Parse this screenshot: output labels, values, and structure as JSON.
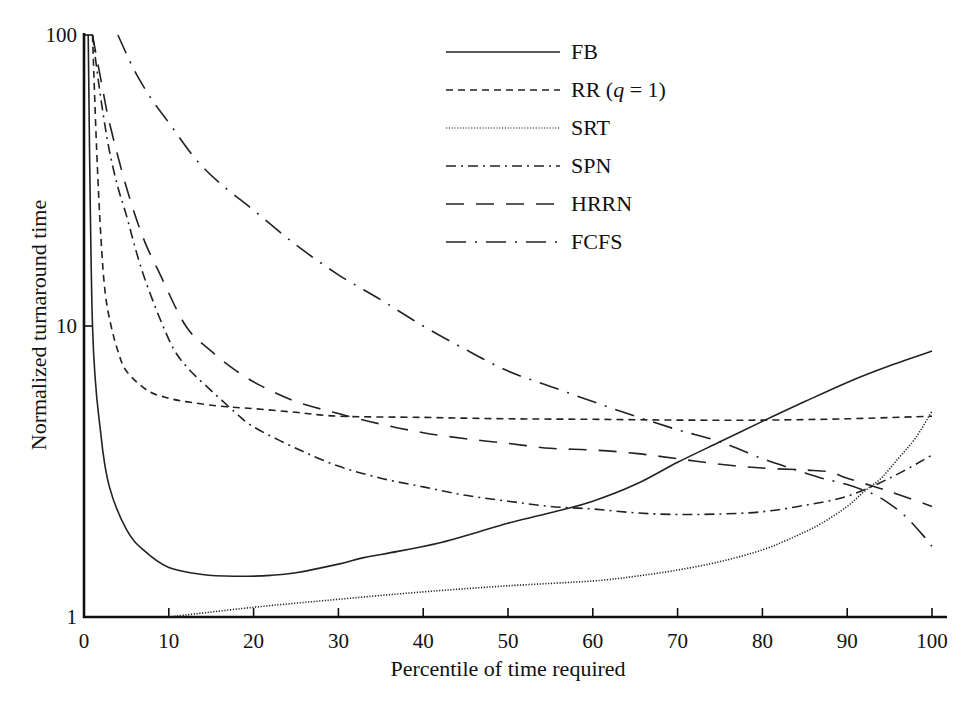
{
  "chart_data": {
    "type": "line",
    "title": "",
    "xlabel": "Percentile of time required",
    "ylabel": "Normalized turnaround time",
    "xlim": [
      0,
      100
    ],
    "ylim": [
      1,
      100
    ],
    "yscale": "log",
    "grid": false,
    "legend_position": "upper-right",
    "x_ticks": [
      "0",
      "10",
      "20",
      "30",
      "40",
      "50",
      "60",
      "70",
      "80",
      "90",
      "100"
    ],
    "y_ticks": [
      "1",
      "10",
      "100"
    ],
    "series": [
      {
        "name": "FB",
        "style": "solid",
        "x": [
          0.5,
          1,
          2,
          3,
          5,
          7,
          10,
          14,
          18,
          22,
          25,
          30,
          33,
          37,
          42,
          46,
          50,
          55,
          60,
          65,
          70,
          75,
          80,
          85,
          90,
          95,
          100
        ],
        "y": [
          100,
          10,
          4.2,
          2.8,
          2.0,
          1.7,
          1.48,
          1.4,
          1.38,
          1.39,
          1.42,
          1.52,
          1.6,
          1.68,
          1.8,
          1.94,
          2.1,
          2.28,
          2.5,
          2.85,
          3.4,
          4.0,
          4.7,
          5.5,
          6.4,
          7.3,
          8.2
        ]
      },
      {
        "name": "RR (q = 1)",
        "style": "dashed",
        "x": [
          1,
          1.5,
          2,
          2.5,
          3.2,
          4,
          5,
          7.5,
          10,
          12,
          16,
          20,
          25,
          30,
          40,
          50,
          60,
          70,
          80,
          90,
          100
        ],
        "y": [
          100,
          40,
          20,
          13,
          10,
          8.2,
          7,
          6,
          5.65,
          5.5,
          5.3,
          5.2,
          5.05,
          4.9,
          4.85,
          4.8,
          4.78,
          4.75,
          4.75,
          4.8,
          4.9
        ]
      },
      {
        "name": "SRT",
        "style": "dotted",
        "x": [
          10,
          20,
          30,
          40,
          50,
          60,
          65,
          70,
          75,
          80,
          84,
          87,
          90,
          92,
          94,
          96,
          98,
          100
        ],
        "y": [
          1.0,
          1.08,
          1.15,
          1.22,
          1.28,
          1.33,
          1.38,
          1.45,
          1.55,
          1.7,
          1.9,
          2.1,
          2.4,
          2.7,
          3.0,
          3.5,
          4.1,
          5.1
        ]
      },
      {
        "name": "SPN",
        "style": "dash-dot",
        "x": [
          1,
          2,
          3,
          4,
          5,
          7,
          10,
          12,
          15,
          18,
          20,
          25,
          30,
          35,
          40,
          45,
          50,
          55,
          60,
          65,
          70,
          75,
          80,
          85,
          90,
          95,
          100
        ],
        "y": [
          100,
          60,
          40,
          30,
          24,
          15,
          9,
          7.3,
          6,
          5.0,
          4.5,
          3.8,
          3.3,
          3.0,
          2.8,
          2.62,
          2.5,
          2.4,
          2.35,
          2.28,
          2.25,
          2.26,
          2.3,
          2.42,
          2.6,
          3.0,
          3.6
        ]
      },
      {
        "name": "HRRN",
        "style": "long-dash",
        "x": [
          1,
          2,
          3,
          5,
          7,
          9,
          12,
          15,
          18,
          21,
          25,
          30,
          35,
          40,
          45,
          50,
          55,
          60,
          65,
          70,
          75,
          80,
          85,
          88,
          90,
          95,
          100
        ],
        "y": [
          100,
          70,
          50,
          30,
          20,
          15,
          10,
          8.2,
          7,
          6.2,
          5.5,
          5.0,
          4.6,
          4.3,
          4.1,
          3.95,
          3.8,
          3.75,
          3.65,
          3.5,
          3.35,
          3.25,
          3.2,
          3.15,
          3.0,
          2.7,
          2.4
        ]
      },
      {
        "name": "FCFS",
        "style": "long-dash-dot",
        "x": [
          4,
          6,
          8,
          10,
          13,
          16,
          20,
          25,
          30,
          35,
          40,
          45,
          50,
          55,
          60,
          65,
          70,
          75,
          80,
          84,
          87,
          90,
          93,
          95,
          97,
          99,
          100
        ],
        "y": [
          100,
          75,
          60,
          50,
          38,
          31,
          25,
          19,
          15,
          12.3,
          10,
          8.3,
          7,
          6.2,
          5.5,
          4.9,
          4.4,
          4.0,
          3.5,
          3.2,
          3.0,
          2.85,
          2.65,
          2.45,
          2.2,
          1.9,
          1.75
        ]
      }
    ]
  },
  "legend": {
    "items": [
      {
        "label": "FB"
      },
      {
        "label": "RR (q = 1)",
        "prefix": "RR (",
        "italic": "q",
        "suffix": " = 1)"
      },
      {
        "label": "SRT"
      },
      {
        "label": "SPN"
      },
      {
        "label": "HRRN"
      },
      {
        "label": "FCFS"
      }
    ]
  },
  "axes": {
    "x_label": "Percentile of time required",
    "y_label": "Normalized turnaround time",
    "x_ticks": [
      "0",
      "10",
      "20",
      "30",
      "40",
      "50",
      "60",
      "70",
      "80",
      "90",
      "100"
    ],
    "y_ticks": [
      "1",
      "10",
      "100"
    ]
  },
  "colors": {
    "line": "#222222",
    "background": "#ffffff"
  }
}
